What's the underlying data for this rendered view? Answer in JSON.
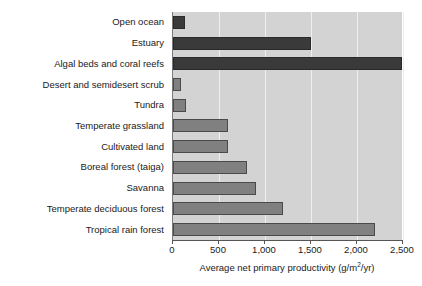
{
  "chart_data": {
    "type": "bar",
    "orientation": "horizontal",
    "title": "",
    "xlabel": "Average net primary productivity (g/m2/yr)",
    "xlabel_parts": {
      "before": "Average net primary productivity (g/m",
      "sup": "2",
      "after": "/yr)"
    },
    "ylabel": "",
    "xlim": [
      0,
      2500
    ],
    "xticks": [
      0,
      500,
      1000,
      1500,
      2000,
      2500
    ],
    "xticklabels": [
      "0",
      "500",
      "1,000",
      "1,500",
      "2,000",
      "2,500"
    ],
    "grid": true,
    "legend": "none",
    "categories": [
      "Open ocean",
      "Estuary",
      "Algal beds and coral reefs",
      "Desert and semidesert scrub",
      "Tundra",
      "Temperate grassland",
      "Cultivated land",
      "Boreal forest (taiga)",
      "Savanna",
      "Temperate deciduous forest",
      "Tropical rain forest"
    ],
    "values": [
      125,
      1500,
      2500,
      90,
      140,
      600,
      600,
      800,
      900,
      1200,
      2200
    ],
    "bar_shades": [
      "dark",
      "dark",
      "dark",
      "mid",
      "mid",
      "mid",
      "mid",
      "mid",
      "mid",
      "mid",
      "mid"
    ],
    "colors": {
      "panel": "#d3d3d3",
      "gridline": "#efefef",
      "bar_dark": "#3a3a3a",
      "bar_mid": "#808080",
      "axis": "#555555",
      "text": "#1a1a1a",
      "background": "#ffffff"
    }
  }
}
